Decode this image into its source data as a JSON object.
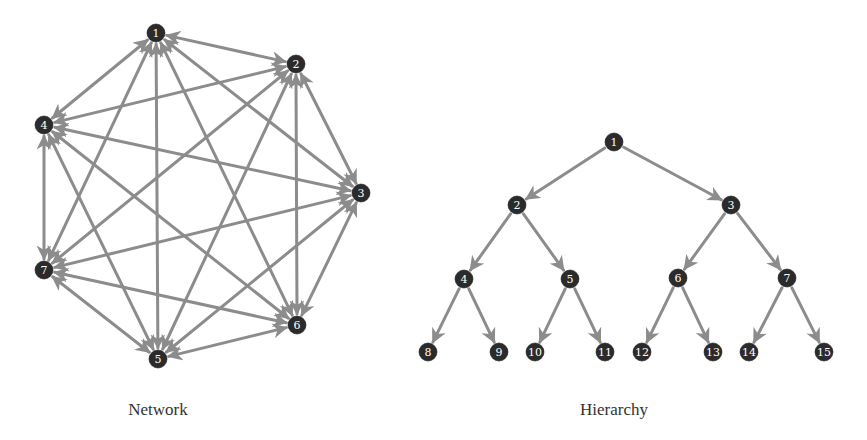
{
  "figures": {
    "network": {
      "caption": "Network",
      "caption_pos": {
        "x": 158,
        "y": 400
      },
      "node_radius": 9,
      "nodes": [
        {
          "id": "1",
          "x": 156,
          "y": 33
        },
        {
          "id": "2",
          "x": 296,
          "y": 64
        },
        {
          "id": "3",
          "x": 361,
          "y": 193
        },
        {
          "id": "4",
          "x": 44,
          "y": 125
        },
        {
          "id": "5",
          "x": 158,
          "y": 359
        },
        {
          "id": "6",
          "x": 297,
          "y": 325
        },
        {
          "id": "7",
          "x": 44,
          "y": 270
        }
      ],
      "edges": [
        [
          "1",
          "2"
        ],
        [
          "1",
          "3"
        ],
        [
          "1",
          "4"
        ],
        [
          "1",
          "5"
        ],
        [
          "1",
          "6"
        ],
        [
          "1",
          "7"
        ],
        [
          "2",
          "3"
        ],
        [
          "2",
          "4"
        ],
        [
          "2",
          "5"
        ],
        [
          "2",
          "6"
        ],
        [
          "2",
          "7"
        ],
        [
          "3",
          "4"
        ],
        [
          "3",
          "5"
        ],
        [
          "3",
          "6"
        ],
        [
          "3",
          "7"
        ],
        [
          "4",
          "5"
        ],
        [
          "4",
          "6"
        ],
        [
          "4",
          "7"
        ],
        [
          "5",
          "6"
        ],
        [
          "5",
          "7"
        ],
        [
          "6",
          "7"
        ]
      ],
      "directed": "bidirectional"
    },
    "hierarchy": {
      "caption": "Hierarchy",
      "caption_pos": {
        "x": 614,
        "y": 400
      },
      "node_radius": 9,
      "nodes": [
        {
          "id": "1",
          "x": 614,
          "y": 142
        },
        {
          "id": "2",
          "x": 517,
          "y": 205
        },
        {
          "id": "3",
          "x": 731,
          "y": 205
        },
        {
          "id": "4",
          "x": 464,
          "y": 279
        },
        {
          "id": "5",
          "x": 570,
          "y": 279
        },
        {
          "id": "6",
          "x": 678,
          "y": 278
        },
        {
          "id": "7",
          "x": 787,
          "y": 278
        },
        {
          "id": "8",
          "x": 428,
          "y": 352
        },
        {
          "id": "9",
          "x": 499,
          "y": 352
        },
        {
          "id": "10",
          "x": 535,
          "y": 352
        },
        {
          "id": "11",
          "x": 605,
          "y": 352
        },
        {
          "id": "12",
          "x": 642,
          "y": 352
        },
        {
          "id": "13",
          "x": 713,
          "y": 352
        },
        {
          "id": "14",
          "x": 749,
          "y": 352
        },
        {
          "id": "15",
          "x": 824,
          "y": 352
        }
      ],
      "edges": [
        [
          "1",
          "2"
        ],
        [
          "1",
          "3"
        ],
        [
          "2",
          "4"
        ],
        [
          "2",
          "5"
        ],
        [
          "3",
          "6"
        ],
        [
          "3",
          "7"
        ],
        [
          "4",
          "8"
        ],
        [
          "4",
          "9"
        ],
        [
          "5",
          "10"
        ],
        [
          "5",
          "11"
        ],
        [
          "6",
          "12"
        ],
        [
          "6",
          "13"
        ],
        [
          "7",
          "14"
        ],
        [
          "7",
          "15"
        ]
      ],
      "directed": "parent-to-child"
    }
  },
  "colors": {
    "edge": "#8c8c8c",
    "node_fill": "#2b2b2b",
    "node_label": "#ffffff",
    "caption": "#333333",
    "background": "#ffffff"
  }
}
